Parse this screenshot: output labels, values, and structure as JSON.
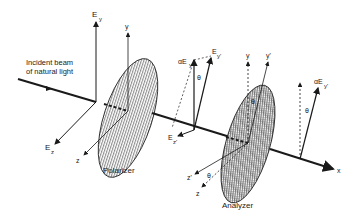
{
  "diagram": {
    "title_caption": "Polarizer and analyzer — transmission of polarized light",
    "beam_label_line1": "Incident beam",
    "beam_label_line2": "of natural light",
    "polarizer_label": "Polarizer",
    "analyzer_label": "Analyzer",
    "axes": {
      "Ey_main": "E",
      "Ey_main_sub": "y",
      "Ez_main": "E",
      "Ez_main_sub": "z",
      "y_polarizer": "y",
      "z_polarizer": "z",
      "x_axis": "x"
    },
    "between_labels": {
      "aEy": "αE",
      "aEy_sub": "y",
      "Eyprime": "E",
      "Eyprime_sub": "y'",
      "Ezprime": "E",
      "Ezprime_sub": "z'",
      "theta": "θ"
    },
    "analyzer_labels": {
      "y": "y",
      "yprime": "y'",
      "theta": "θ",
      "zprime": "z'",
      "z": "z",
      "theta_bottom": "θ"
    },
    "output_labels": {
      "aEyprime": "αE",
      "aEyprime_sub": "y'",
      "theta": "θ"
    },
    "colors": {
      "line": "#1a1a1a",
      "hatch_polarizer": "#555555",
      "hatch_analyzer": "#444444",
      "background": "#ffffff"
    }
  }
}
